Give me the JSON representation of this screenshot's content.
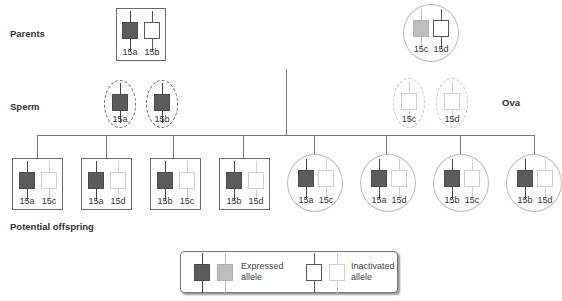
{
  "labels": {
    "parents": "Parents",
    "sperm": "Sperm",
    "ova": "Ova",
    "offspring": "Potential offspring"
  },
  "parents": {
    "father": {
      "alleles": [
        {
          "name": "15a",
          "state": "expressed"
        },
        {
          "name": "15b",
          "state": "inactivated"
        }
      ]
    },
    "mother": {
      "alleles": [
        {
          "name": "15c",
          "state": "expressed"
        },
        {
          "name": "15d",
          "state": "inactivated"
        }
      ]
    }
  },
  "sperm": [
    "15a",
    "15b"
  ],
  "ova": [
    "15c",
    "15d"
  ],
  "offspring": [
    {
      "a": "15a",
      "b": "15c",
      "frame": "box"
    },
    {
      "a": "15a",
      "b": "15d",
      "frame": "box"
    },
    {
      "a": "15b",
      "b": "15c",
      "frame": "box"
    },
    {
      "a": "15b",
      "b": "15d",
      "frame": "box"
    },
    {
      "a": "15a",
      "b": "15c",
      "frame": "circle"
    },
    {
      "a": "15a",
      "b": "15d",
      "frame": "circle"
    },
    {
      "a": "15b",
      "b": "15c",
      "frame": "circle"
    },
    {
      "a": "15b",
      "b": "15d",
      "frame": "circle"
    }
  ],
  "legend": {
    "expressed_line1": "Expressed",
    "expressed_line2": "allele",
    "inactivated_line1": "Inactivated",
    "inactivated_line2": "allele"
  },
  "colors": {
    "expressed_dark": "#5c5c5c",
    "expressed_light": "#bdbdbd",
    "inactivated_dark": "#555555",
    "inactivated_light": "#cfcfcf",
    "line": "#777777"
  }
}
